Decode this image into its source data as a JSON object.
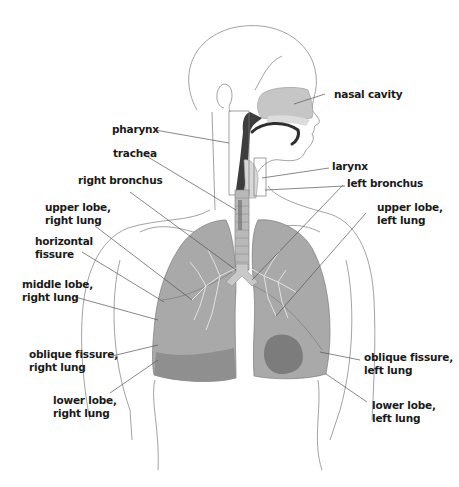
{
  "diagram": {
    "type": "anatomy-labeled-illustration",
    "colors": {
      "outline": "#8a8a8a",
      "lung_fill": "#a9a9a9",
      "lung_dark": "#7c7c7c",
      "nasal_fill": "#c6c6c6",
      "pharynx_dark": "#3d3d3d",
      "leader_line": "#555555",
      "label_text": "#1a1a1a"
    },
    "labels": {
      "nasal_cavity": "nasal cavity",
      "pharynx": "pharynx",
      "trachea": "trachea",
      "larynx": "larynx",
      "right_bronchus": "right bronchus",
      "left_bronchus": "left bronchus",
      "upper_lobe_right_l1": "upper lobe,",
      "upper_lobe_right_l2": "right lung",
      "upper_lobe_left_l1": "upper lobe,",
      "upper_lobe_left_l2": "left lung",
      "horizontal_fissure_l1": "horizontal",
      "horizontal_fissure_l2": "fissure",
      "middle_lobe_right_l1": "middle lobe,",
      "middle_lobe_right_l2": "right lung",
      "oblique_fissure_right_l1": "oblique fissure,",
      "oblique_fissure_right_l2": "right lung",
      "oblique_fissure_left_l1": "oblique fissure,",
      "oblique_fissure_left_l2": "left lung",
      "lower_lobe_right_l1": "lower lobe,",
      "lower_lobe_right_l2": "right lung",
      "lower_lobe_left_l1": "lower lobe,",
      "lower_lobe_left_l2": "left lung"
    }
  }
}
